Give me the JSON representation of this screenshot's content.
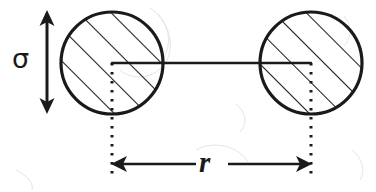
{
  "figure": {
    "background_color": "#ffffff",
    "ink_color": "#1a1a1a",
    "labels": {
      "diameter_symbol": "σ",
      "distance_symbol": "r"
    },
    "geometry": {
      "left_circle": {
        "cx": 112,
        "cy": 63,
        "r": 51
      },
      "right_circle": {
        "cx": 311,
        "cy": 63,
        "r": 51
      },
      "center_line": {
        "x1": 112,
        "y1": 63,
        "x2": 311,
        "y2": 63
      },
      "sigma_arrow": {
        "x": 47,
        "y_top": 12,
        "y_bottom": 112
      },
      "r_arrow": {
        "y": 164,
        "x_left": 112,
        "x_right": 311
      },
      "extension_lines": [
        {
          "x": 112,
          "y_top": 63,
          "y_bottom": 176
        },
        {
          "x": 311,
          "y_top": 63,
          "y_bottom": 176
        }
      ],
      "hatch_angle_deg": 45,
      "hatch_spacing_px": 23
    },
    "icons": {
      "sigma_arrow_name": "double-headed-vertical-arrow-icon",
      "r_arrow_name": "double-headed-horizontal-arrow-icon"
    }
  }
}
